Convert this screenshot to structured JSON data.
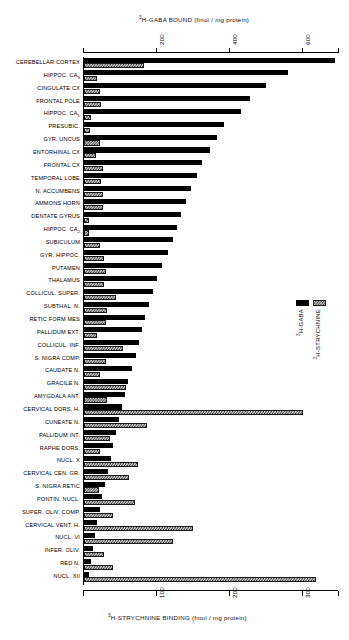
{
  "figure": {
    "top_axis_title": "H-GABA BOUND (fmol / mg protein)",
    "top_axis_title_sup": "3",
    "bottom_axis_title": "H-STRYCHNINE BINDING (fmol / mg protein)",
    "bottom_axis_title_sup": "3"
  },
  "legend": {
    "position": "right-middle",
    "items": [
      {
        "label": "H-GABA",
        "sup": "3",
        "swatch": "solid-black",
        "color": "#000000"
      },
      {
        "label": "H-STRYCHNINE",
        "sup": "3",
        "swatch": "hatched-gray",
        "color": "#cfcfcf"
      }
    ]
  },
  "chart_data": {
    "type": "bar",
    "orientation": "horizontal",
    "title": "3H-GABA BOUND (fmol / mg protein)",
    "xlabel": "3H-GABA BOUND (fmol / mg protein)",
    "xlabel_secondary": "3H-STRYCHNINE BINDING (fmol / mg protein)",
    "ylabel": "",
    "grid": false,
    "legend_position": "right",
    "top_axis": {
      "name": "3H-GABA BOUND (fmol / mg protein)",
      "ticks": [
        200,
        400,
        600
      ],
      "xlim": [
        0,
        700
      ]
    },
    "bottom_axis": {
      "name": "3H-STRYCHNINE BINDING (fmol / mg protein)",
      "ticks": [
        100,
        200,
        300
      ],
      "xlim": [
        0,
        350
      ]
    },
    "categories": [
      "CEREBELLAR CORTEX",
      "HIPPOC. CA3",
      "CINGULATE CX",
      "FRONTAL POLE",
      "HIPPOC. CA1",
      "PRESUBIC.",
      "GYR. UNCUS",
      "ENTORHINAL CX",
      "FRONTAL CX",
      "TEMPORAL LOBE",
      "N. ACCUMBENS",
      "AMMONS HORN",
      "DENTATE GYRUS",
      "HIPPOC. CA2",
      "SUBICULUM",
      "GYR. HIPPOC.",
      "PUTAMEN",
      "THALAMUS",
      "COLLICUL. SUPER.",
      "SUBTHAL. N.",
      "RETIC FORM MES",
      "PALLIDUM EXT.",
      "COLLICUL. INF.",
      "S. NIGRA COMP.",
      "CAUDATE N.",
      "GRACILE N.",
      "AMYGDALA ANT.",
      "CERVICAL DORS. H.",
      "CUNEATE N.",
      "PALLIDUM INT.",
      "RAPHE DORS.",
      "NUCL. X",
      "CERVICAL CEN. GR.",
      "S. NIGRA RETIC",
      "PONTIN. NUCL.",
      "SUPER. OLIV. COMP.",
      "CERVICAL VENT. H.",
      "NUCL. VI",
      "INFER. OLIV.",
      "RED N.",
      "NUCL. XII"
    ],
    "series": [
      {
        "name": "3H-GABA",
        "unit": "fmol / mg protein",
        "color": "#000000",
        "values": [
          690,
          560,
          500,
          455,
          430,
          385,
          365,
          345,
          325,
          310,
          295,
          280,
          265,
          255,
          245,
          230,
          215,
          200,
          190,
          178,
          168,
          160,
          150,
          142,
          133,
          120,
          112,
          103,
          96,
          88,
          80,
          74,
          66,
          58,
          50,
          44,
          36,
          30,
          24,
          18,
          14
        ]
      },
      {
        "name": "3H-STRYCHNINE",
        "unit": "fmol / mg protein",
        "color": "#cfcfcf",
        "values": [
          82,
          18,
          22,
          24,
          9,
          8,
          22,
          16,
          26,
          24,
          26,
          26,
          7,
          7,
          22,
          28,
          30,
          28,
          44,
          32,
          30,
          18,
          54,
          30,
          22,
          58,
          32,
          300,
          86,
          36,
          22,
          74,
          62,
          20,
          70,
          40,
          150,
          122,
          28,
          40,
          318
        ]
      }
    ]
  }
}
